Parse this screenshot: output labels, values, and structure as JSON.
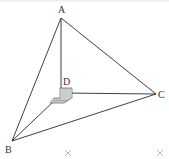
{
  "diagram": {
    "type": "tetrahedron",
    "vertices": {
      "A": {
        "label": "A",
        "x": 61,
        "y": 18
      },
      "B": {
        "label": "B",
        "x": 12,
        "y": 141
      },
      "C": {
        "label": "C",
        "x": 156,
        "y": 94
      },
      "D": {
        "label": "D",
        "x": 61,
        "y": 91
      }
    },
    "edges": [
      [
        "A",
        "B"
      ],
      [
        "A",
        "C"
      ],
      [
        "A",
        "D"
      ],
      [
        "B",
        "C"
      ],
      [
        "B",
        "D"
      ],
      [
        "C",
        "D"
      ]
    ],
    "right_angle_marker_at": "D",
    "markers": [
      {
        "symbol": "×",
        "x": 68,
        "y": 153
      },
      {
        "symbol": "×",
        "x": 160,
        "y": 153
      }
    ],
    "colors": {
      "line": "#2a2a2a",
      "label": "#333333",
      "marker": "#aaaaaa"
    }
  }
}
